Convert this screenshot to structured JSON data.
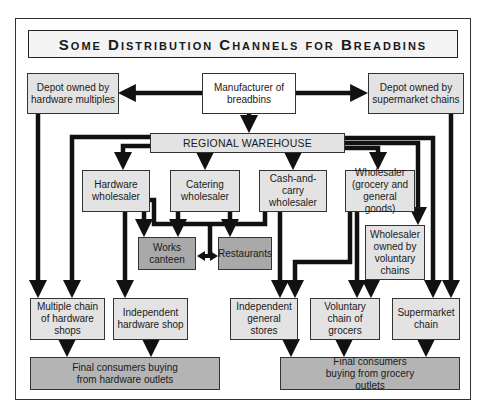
{
  "title": "Some Distribution Channels for Breadbins",
  "nodes": {
    "depot_hardware": "Depot owned by hardware multiples",
    "manufacturer": "Manufacturer of breadbins",
    "depot_supermarket": "Depot owned by supermarket chains",
    "regional_warehouse": "REGIONAL WAREHOUSE",
    "hardware_wholesaler": "Hardware wholesaler",
    "catering_wholesaler": "Catering wholesaler",
    "cash_and_carry": "Cash-and-carry wholesaler",
    "wholesaler_grocery": "Wholesaler (grocery and general goods)",
    "works_canteen": "Works canteen",
    "restaurants": "Restaurants",
    "wholesaler_voluntary": "Wholesaler owned by voluntary chains",
    "multiple_chain_hardware": "Multiple chain of hardware shops",
    "independent_hardware": "Independent hardware shop",
    "independent_general": "Independent general stores",
    "voluntary_chain": "Voluntary chain of grocers",
    "supermarket_chain": "Supermarket chain",
    "final_hardware": "Final consumers buying from hardware outlets",
    "final_grocery": "Final consumers buying from grocery outlets"
  },
  "edges": [
    [
      "manufacturer",
      "depot_hardware"
    ],
    [
      "manufacturer",
      "depot_supermarket"
    ],
    [
      "manufacturer",
      "regional_warehouse"
    ],
    [
      "depot_hardware",
      "multiple_chain_hardware"
    ],
    [
      "depot_supermarket",
      "supermarket_chain"
    ],
    [
      "regional_warehouse",
      "multiple_chain_hardware"
    ],
    [
      "regional_warehouse",
      "hardware_wholesaler"
    ],
    [
      "regional_warehouse",
      "catering_wholesaler"
    ],
    [
      "regional_warehouse",
      "cash_and_carry"
    ],
    [
      "regional_warehouse",
      "wholesaler_grocery"
    ],
    [
      "regional_warehouse",
      "wholesaler_voluntary"
    ],
    [
      "regional_warehouse",
      "supermarket_chain"
    ],
    [
      "hardware_wholesaler",
      "independent_hardware"
    ],
    [
      "hardware_wholesaler",
      "works_canteen"
    ],
    [
      "hardware_wholesaler",
      "restaurants"
    ],
    [
      "catering_wholesaler",
      "works_canteen"
    ],
    [
      "catering_wholesaler",
      "restaurants"
    ],
    [
      "cash_and_carry",
      "works_canteen"
    ],
    [
      "cash_and_carry",
      "restaurants"
    ],
    [
      "cash_and_carry",
      "independent_general"
    ],
    [
      "wholesaler_grocery",
      "independent_general"
    ],
    [
      "wholesaler_grocery",
      "voluntary_chain"
    ],
    [
      "wholesaler_voluntary",
      "voluntary_chain"
    ],
    [
      "multiple_chain_hardware",
      "final_hardware"
    ],
    [
      "independent_hardware",
      "final_hardware"
    ],
    [
      "independent_general",
      "final_grocery"
    ],
    [
      "voluntary_chain",
      "final_grocery"
    ],
    [
      "supermarket_chain",
      "final_grocery"
    ]
  ]
}
